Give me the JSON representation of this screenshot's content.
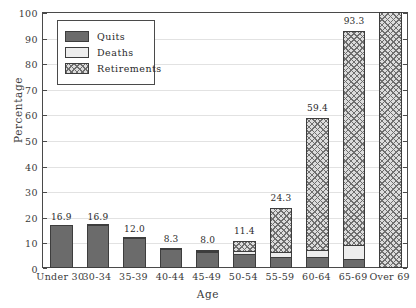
{
  "chart_data": {
    "type": "bar",
    "stacked": true,
    "title": "",
    "xlabel": "Age",
    "ylabel": "Percentage",
    "ylim": [
      0,
      100
    ],
    "ytick_labels": [
      "0",
      "10",
      "20",
      "30",
      "40",
      "50",
      "60",
      "70",
      "80",
      "90",
      "100"
    ],
    "ytick_values": [
      0,
      10,
      20,
      30,
      40,
      50,
      60,
      70,
      80,
      90,
      100
    ],
    "grid": true,
    "legend_position": "upper-left-inside",
    "categories": [
      "Under 30",
      "30-34",
      "35-39",
      "40-44",
      "45-49",
      "50-54",
      "55-59",
      "60-64",
      "65-69",
      "Over 69"
    ],
    "series": [
      {
        "name": "Quits",
        "color": "#6b6b6b",
        "values": [
          16.9,
          16.8,
          11.6,
          7.5,
          6.2,
          5.6,
          4.4,
          4.3,
          3.4,
          0.0
        ]
      },
      {
        "name": "Deaths",
        "color": "#ededed",
        "values": [
          0.0,
          0.1,
          0.4,
          0.8,
          1.0,
          1.5,
          2.1,
          3.0,
          5.9,
          0.0
        ]
      },
      {
        "name": "Retirements",
        "color": "#dcdcdc",
        "values": [
          0.0,
          0.0,
          0.0,
          0.0,
          0.8,
          4.3,
          17.8,
          52.1,
          84.0,
          100.0
        ]
      }
    ],
    "totals": [
      16.9,
      16.9,
      12.0,
      8.3,
      8.0,
      11.4,
      24.3,
      59.4,
      93.3,
      100.0
    ],
    "bar_labels": [
      "16.9",
      "16.9",
      "12.0",
      "8.3",
      "8.0",
      "11.4",
      "24.3",
      "59.4",
      "93.3",
      ""
    ]
  },
  "legend": {
    "items": [
      {
        "label": "Quits"
      },
      {
        "label": "Deaths"
      },
      {
        "label": "Retirements"
      }
    ]
  }
}
